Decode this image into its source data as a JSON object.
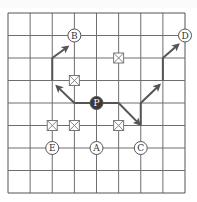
{
  "diagram": {
    "grid": {
      "cols": 8,
      "rows": 8,
      "origin_x": 8,
      "origin_y": 13,
      "cell_w": 22.125,
      "cell_h": 22.5,
      "line_color": "#6e6e6e",
      "border_color": "#555555"
    },
    "nodes": [
      {
        "id": "P",
        "label": "P",
        "col": 4,
        "row": 4,
        "filled": true
      },
      {
        "id": "B",
        "label": "B",
        "col": 3,
        "row": 1,
        "filled": false
      },
      {
        "id": "D",
        "label": "D",
        "col": 8,
        "row": 1,
        "filled": false
      },
      {
        "id": "E",
        "label": "E",
        "col": 2,
        "row": 6,
        "filled": false
      },
      {
        "id": "A",
        "label": "A",
        "col": 4,
        "row": 6,
        "filled": false
      },
      {
        "id": "C",
        "label": "C",
        "col": 6,
        "row": 6,
        "filled": false
      }
    ],
    "obstacles": [
      {
        "col": 5,
        "row": 2
      },
      {
        "col": 3,
        "row": 3
      },
      {
        "col": 2,
        "row": 5
      },
      {
        "col": 3,
        "row": 5
      },
      {
        "col": 5,
        "row": 5
      }
    ],
    "paths": [
      {
        "name": "path-to-B",
        "segments": [
          {
            "type": "line",
            "from": [
              4,
              4
            ],
            "to": [
              3,
              4
            ]
          },
          {
            "type": "arrow",
            "from": [
              3,
              4
            ],
            "to": [
              2.2,
              3.25
            ]
          },
          {
            "type": "line",
            "from": [
              2,
              3
            ],
            "to": [
              2,
              2
            ]
          },
          {
            "type": "arrow",
            "from": [
              2,
              2
            ],
            "to": [
              2.7,
              1.5
            ]
          }
        ]
      },
      {
        "name": "path-to-D",
        "segments": [
          {
            "type": "line",
            "from": [
              4,
              4
            ],
            "to": [
              5,
              4
            ]
          },
          {
            "type": "arrow",
            "from": [
              5,
              4
            ],
            "to": [
              5.95,
              4.95
            ]
          },
          {
            "type": "line",
            "from": [
              6,
              5
            ],
            "to": [
              6,
              4
            ]
          },
          {
            "type": "arrow",
            "from": [
              6,
              4
            ],
            "to": [
              6.85,
              3.2
            ]
          },
          {
            "type": "line",
            "from": [
              7,
              3
            ],
            "to": [
              7,
              2
            ]
          },
          {
            "type": "arrow",
            "from": [
              7,
              2
            ],
            "to": [
              7.7,
              1.4
            ]
          }
        ]
      }
    ],
    "colors": {
      "path": "#555555",
      "node_fill": "#ffffff",
      "node_stroke": "#555555",
      "filled_node": "#3a3a3a",
      "obstacle_stroke": "#777777"
    }
  }
}
